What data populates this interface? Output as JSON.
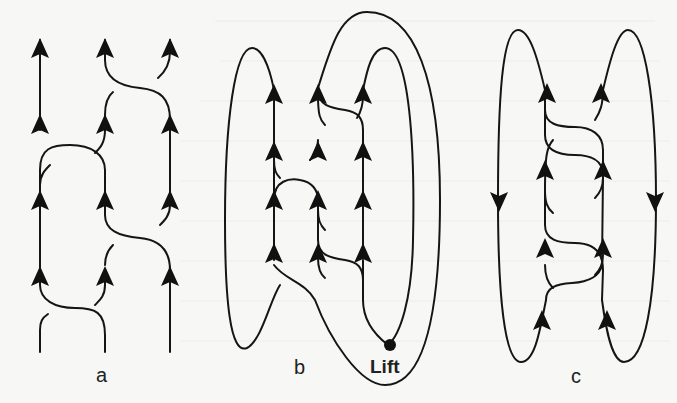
{
  "figure": {
    "panels": [
      {
        "id": "a",
        "label": "a",
        "strand_count": 3
      },
      {
        "id": "b",
        "label": "b",
        "annotation": "Lift",
        "strand_count": 3
      },
      {
        "id": "c",
        "label": "c",
        "strand_count": 2
      }
    ],
    "colors": {
      "ink": "#151515",
      "background": "#f7f7f5"
    }
  }
}
